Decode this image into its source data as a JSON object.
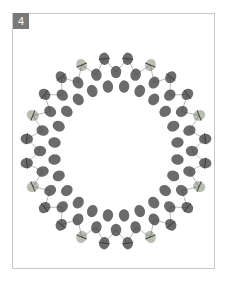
{
  "diagram": {
    "step_number": "4",
    "type": "beaded-ring",
    "center": [
      116,
      151
    ],
    "outer_radius": [
      90,
      93
    ],
    "middle_radius": [
      76,
      79
    ],
    "inner_radius": [
      62,
      65
    ],
    "outer_count": 24,
    "middle_count": 24,
    "inner_count": 24,
    "colors": {
      "dark_bead": "#6b6b6b",
      "light_bead": "#b8bfb0",
      "thread": "#3a3a3a",
      "frame": "#c8c8c8",
      "badge": "#7a7a7a"
    }
  }
}
